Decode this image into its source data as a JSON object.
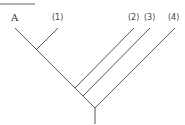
{
  "diagram": {
    "type": "cladogram",
    "line_color": "#555555",
    "header_rule_color": "#9a9a9a",
    "labels": [
      {
        "id": "A",
        "text": "A",
        "x": 11,
        "y": 13
      },
      {
        "id": "n1",
        "text": "(1)",
        "x": 52,
        "y": 13
      },
      {
        "id": "n2",
        "text": "(2)",
        "x": 128,
        "y": 13
      },
      {
        "id": "n3",
        "text": "(3)",
        "x": 144,
        "y": 13
      },
      {
        "id": "n4",
        "text": "(4)",
        "x": 168,
        "y": 13
      }
    ],
    "branches": [
      {
        "from": "A",
        "x1": 15,
        "y1": 28,
        "x2": 95,
        "y2": 108
      },
      {
        "from": "(1)",
        "x1": 58,
        "y1": 28,
        "x2": 37,
        "y2": 49
      },
      {
        "from": "(2)",
        "x1": 134,
        "y1": 28,
        "x2": 75,
        "y2": 88
      },
      {
        "from": "(3)",
        "x1": 150,
        "y1": 28,
        "x2": 83,
        "y2": 96
      },
      {
        "from": "(4)",
        "x1": 175,
        "y1": 28,
        "x2": 95,
        "y2": 108
      },
      {
        "from": "root",
        "x1": 95,
        "y1": 108,
        "x2": 95,
        "y2": 124
      }
    ]
  }
}
